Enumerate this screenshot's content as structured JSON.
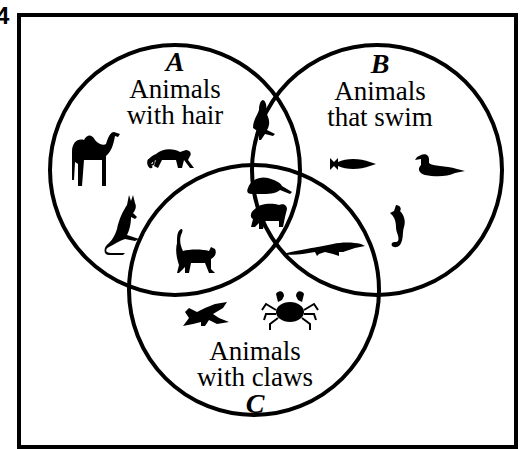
{
  "question_number": "4",
  "diagram": {
    "type": "venn-3-set",
    "sets": [
      {
        "letter": "A",
        "line1": "Animals",
        "line2": "with hair"
      },
      {
        "letter": "B",
        "line1": "Animals",
        "line2": "that swim"
      },
      {
        "letter": "C",
        "line1": "Animals",
        "line2": "with claws"
      }
    ],
    "regions": {
      "A_only": [
        "camel",
        "monkey",
        "kangaroo"
      ],
      "B_only": [
        "fish",
        "duck",
        "seahorse"
      ],
      "C_only": [
        "bird",
        "crab"
      ],
      "A_and_B_only": [
        "seal"
      ],
      "A_and_C_only": [
        "cat"
      ],
      "B_and_C_only": [
        "alligator"
      ],
      "A_and_B_and_C": [
        "beaver",
        "bear"
      ]
    },
    "colors": {
      "stroke": "#000000",
      "background": "#ffffff"
    }
  }
}
